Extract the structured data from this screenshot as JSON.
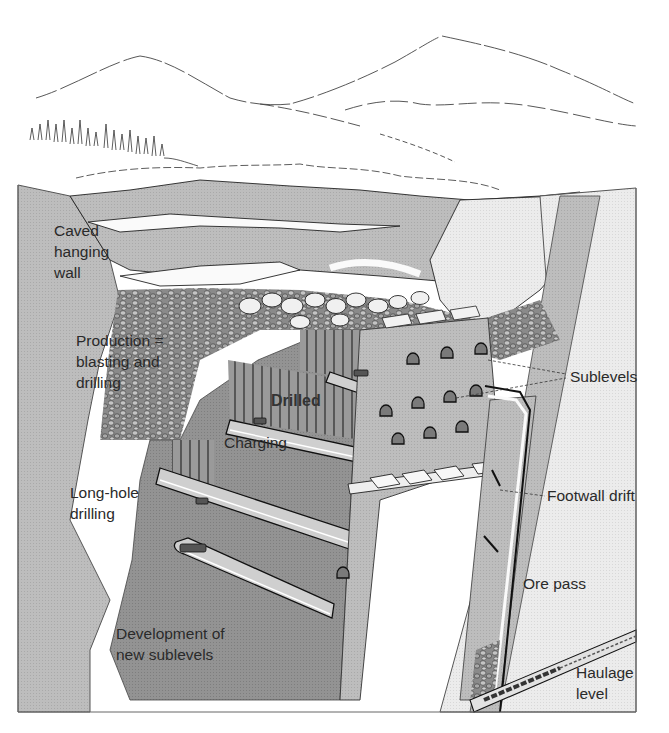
{
  "diagram": {
    "labels": {
      "caved_hanging_wall": "Caved\nhanging\nwall",
      "production": "Production =\nblasting and\ndrilling",
      "drilled": "Drilled",
      "charging": "Charging",
      "long_hole_drilling": "Long-hole\ndrilling",
      "development": "Development of\nnew sublevels",
      "sublevels": "Sublevels",
      "footwall_drift": "Footwall drift",
      "ore_pass": "Ore pass",
      "haulage_level": "Haulage\nlevel"
    },
    "colors": {
      "background": "#ffffff",
      "hanging_wall": "#b9b9b9",
      "ore_body": "#8f8f8f",
      "footwall": "#e6e6e6",
      "panel_light": "#cfcfcf",
      "rubble": "#7a7a7a",
      "line": "#1e1e1e"
    }
  }
}
